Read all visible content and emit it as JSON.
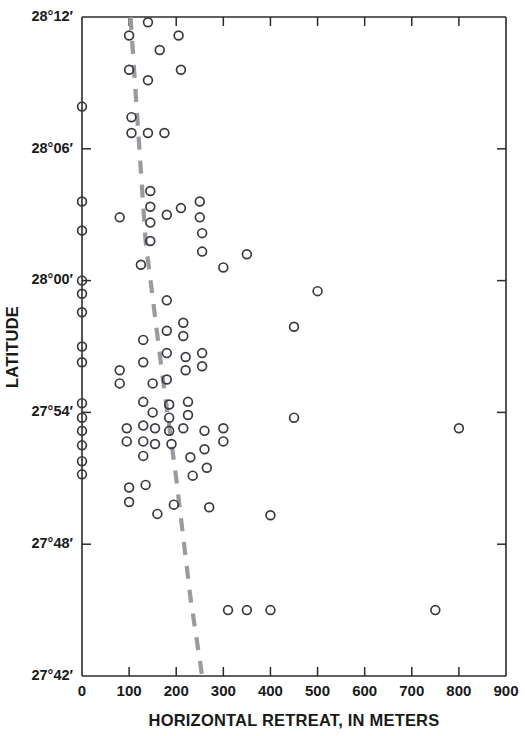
{
  "chart_data": {
    "type": "scatter",
    "title": "",
    "xlabel": "HORIZONTAL RETREAT, IN METERS",
    "ylabel": "LATITUDE",
    "xlim": [
      0,
      900
    ],
    "ylim": [
      27.7,
      28.2
    ],
    "grid": false,
    "legend": null,
    "x_ticks": [
      0,
      100,
      200,
      300,
      400,
      500,
      600,
      700,
      800,
      900
    ],
    "x_tick_labels": [
      "0",
      "100",
      "200",
      "300",
      "400",
      "500",
      "600",
      "700",
      "800",
      "900"
    ],
    "y_ticks": [
      27.7,
      27.8,
      27.9,
      28.0,
      28.1,
      28.2
    ],
    "y_tick_labels": [
      "27°42′",
      "27°48′",
      "27°54′",
      "28°00′",
      "28°06′",
      "28°12′"
    ],
    "series": [
      {
        "name": "shoreline retreat observations",
        "marker": "open-circle",
        "marker_color": "#3a3a42",
        "points": [
          [
            0,
            28.132
          ],
          [
            0,
            28.06
          ],
          [
            0,
            28.038
          ],
          [
            0,
            28.0
          ],
          [
            0,
            27.99
          ],
          [
            0,
            27.976
          ],
          [
            0,
            27.95
          ],
          [
            0,
            27.938
          ],
          [
            0,
            27.907
          ],
          [
            0,
            27.896
          ],
          [
            0,
            27.886
          ],
          [
            0,
            27.875
          ],
          [
            0,
            27.863
          ],
          [
            0,
            27.853
          ],
          [
            80,
            28.048
          ],
          [
            80,
            27.932
          ],
          [
            80,
            27.922
          ],
          [
            95,
            27.888
          ],
          [
            95,
            27.878
          ],
          [
            100,
            28.186
          ],
          [
            100,
            28.16
          ],
          [
            105,
            28.124
          ],
          [
            105,
            28.112
          ],
          [
            100,
            27.843
          ],
          [
            100,
            27.832
          ],
          [
            125,
            28.012
          ],
          [
            130,
            27.955
          ],
          [
            130,
            27.938
          ],
          [
            130,
            27.908
          ],
          [
            130,
            27.89
          ],
          [
            130,
            27.878
          ],
          [
            130,
            27.867
          ],
          [
            135,
            27.845
          ],
          [
            140,
            28.196
          ],
          [
            140,
            28.152
          ],
          [
            140,
            28.112
          ],
          [
            145,
            28.068
          ],
          [
            145,
            28.056
          ],
          [
            145,
            28.044
          ],
          [
            145,
            28.03
          ],
          [
            150,
            27.922
          ],
          [
            150,
            27.9
          ],
          [
            155,
            27.888
          ],
          [
            155,
            27.876
          ],
          [
            160,
            27.823
          ],
          [
            165,
            28.175
          ],
          [
            175,
            28.112
          ],
          [
            180,
            28.05
          ],
          [
            180,
            27.985
          ],
          [
            180,
            27.962
          ],
          [
            180,
            27.945
          ],
          [
            180,
            27.925
          ],
          [
            185,
            27.906
          ],
          [
            185,
            27.896
          ],
          [
            185,
            27.886
          ],
          [
            190,
            27.876
          ],
          [
            195,
            27.83
          ],
          [
            205,
            28.186
          ],
          [
            210,
            28.16
          ],
          [
            210,
            28.055
          ],
          [
            215,
            27.968
          ],
          [
            215,
            27.958
          ],
          [
            215,
            27.888
          ],
          [
            220,
            27.942
          ],
          [
            220,
            27.932
          ],
          [
            225,
            27.908
          ],
          [
            225,
            27.898
          ],
          [
            230,
            27.866
          ],
          [
            235,
            27.852
          ],
          [
            250,
            28.06
          ],
          [
            250,
            28.048
          ],
          [
            255,
            28.036
          ],
          [
            255,
            28.022
          ],
          [
            255,
            27.945
          ],
          [
            255,
            27.935
          ],
          [
            260,
            27.886
          ],
          [
            260,
            27.872
          ],
          [
            265,
            27.858
          ],
          [
            270,
            27.828
          ],
          [
            300,
            28.01
          ],
          [
            300,
            27.888
          ],
          [
            300,
            27.878
          ],
          [
            310,
            27.75
          ],
          [
            350,
            28.02
          ],
          [
            350,
            27.75
          ],
          [
            400,
            27.822
          ],
          [
            400,
            27.75
          ],
          [
            450,
            27.965
          ],
          [
            450,
            27.896
          ],
          [
            500,
            27.992
          ],
          [
            750,
            27.75
          ],
          [
            800,
            27.888
          ]
        ]
      }
    ],
    "trend_line": {
      "style": "dashed",
      "color": "#9a9aa0",
      "description": "dashed reference trend line sloping from upper-left toward lower-right",
      "points": [
        [
          103,
          28.2
        ],
        [
          135,
          28.03
        ],
        [
          170,
          27.93
        ],
        [
          200,
          27.85
        ],
        [
          230,
          27.76
        ],
        [
          255,
          27.7
        ]
      ]
    }
  },
  "layout": {
    "plot_left_px": 82,
    "plot_right_px": 506,
    "plot_top_px": 17,
    "plot_bottom_px": 676
  }
}
